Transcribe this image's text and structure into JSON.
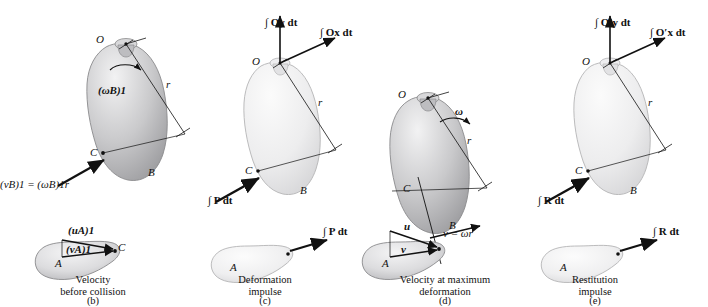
{
  "figure": {
    "title_not_shown": "",
    "panels": [
      {
        "key": "b",
        "caption_line1": "Velocity",
        "caption_line2": "before collision",
        "tag": "(b)",
        "labels": {
          "O": "O",
          "C": "C",
          "B": "B",
          "A": "A",
          "r": "r",
          "omega_B1": "(ωB)1",
          "v_B1": "(vB)1 = (ωB)1r",
          "u_A1": "(uA)1",
          "v_A": "(vA)1"
        }
      },
      {
        "key": "c",
        "caption_line1": "Deformation",
        "caption_line2": "impulse",
        "tag": "(c)",
        "labels": {
          "O": "O",
          "C": "C",
          "B": "B",
          "A": "A",
          "r": "r",
          "impulse_P": "∫ P dt",
          "impulse_P2": "∫ P dt"
        }
      },
      {
        "key": "d",
        "caption_line1": "Velocity at maximum",
        "caption_line2": "deformation",
        "tag": "(d)",
        "labels": {
          "O": "O",
          "C": "C",
          "B": "B",
          "A": "A",
          "r": "r",
          "omega": "ω",
          "u": "u",
          "v": "v",
          "v_omega_r": "v = ωr"
        }
      },
      {
        "key": "e",
        "caption_line1": "Restitution",
        "caption_line2": "impulse",
        "tag": "(e)",
        "labels": {
          "O": "O",
          "C": "C",
          "B": "B",
          "A": "A",
          "r": "r",
          "impulse_R": "∫ R dt",
          "impulse_R2": "∫ R dt"
        }
      }
    ],
    "axes": {
      "c_vertical": "∫ Oy dt",
      "c_horizontal": "∫ Ox dt",
      "e_vertical": "∫ O′y dt",
      "e_horizontal": "∫ O′x dt"
    },
    "colors": {
      "body_light": "#ececed",
      "body_mid": "#c9c9ca",
      "body_dark": "#a6a6a8",
      "outline": "#8c8c8e",
      "ink": "#111111"
    }
  }
}
